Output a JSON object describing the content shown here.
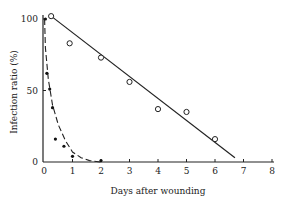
{
  "chart_data": {
    "type": "scatter",
    "title": "",
    "xlabel": "Days after wounding",
    "ylabel": "Infection ratio (%)",
    "xlim": [
      0,
      8
    ],
    "ylim": [
      0,
      100
    ],
    "x_ticks": [
      "0",
      "1",
      "2",
      "3",
      "4",
      "5",
      "6",
      "7",
      "8"
    ],
    "y_ticks": [
      "0",
      "50",
      "100"
    ],
    "grid": false,
    "legend": null,
    "series": [
      {
        "name": "open circles",
        "marker": "open-circle",
        "x": [
          0.25,
          0.9,
          2.0,
          3.0,
          4.0,
          5.0,
          6.0
        ],
        "y": [
          102,
          83,
          73,
          56,
          37,
          35,
          16
        ],
        "fit": {
          "type": "linear",
          "from": [
            0.25,
            102
          ],
          "to": [
            6.7,
            3
          ]
        }
      },
      {
        "name": "filled dots",
        "marker": "filled-dot",
        "x": [
          0.05,
          0.1,
          0.2,
          0.3,
          0.4,
          0.7,
          1.0,
          2.0
        ],
        "y": [
          100,
          62,
          51,
          38,
          16,
          11,
          4,
          1
        ],
        "fit": {
          "type": "exponential-decay",
          "curve": [
            [
              0.02,
              100
            ],
            [
              0.05,
              80
            ],
            [
              0.15,
              58
            ],
            [
              0.3,
              40
            ],
            [
              0.5,
              26
            ],
            [
              0.75,
              15
            ],
            [
              1.0,
              7
            ],
            [
              1.3,
              3
            ],
            [
              1.6,
              1
            ],
            [
              2.0,
              0
            ]
          ]
        }
      }
    ]
  }
}
